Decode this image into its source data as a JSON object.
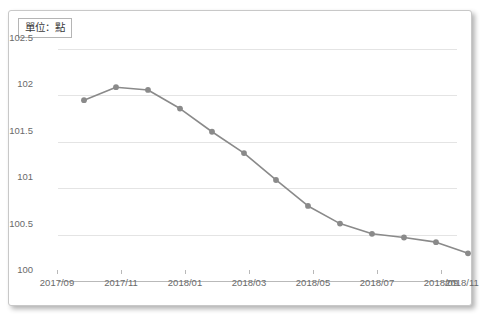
{
  "unit_label": "單位：點",
  "colors": {
    "line": "#8a8a8a",
    "marker": "#8a8a8a",
    "gridline": "#e4e4e4",
    "axis": "#b9b9b9",
    "tick_text": "#6a6a6a",
    "frame_border": "#c8c8c8",
    "background": "#ffffff"
  },
  "chart_data": {
    "type": "line",
    "title": "",
    "subtitle": "",
    "xlabel": "",
    "ylabel": "單位：點",
    "ylim": [
      100,
      102.5
    ],
    "ytick_labels": [
      "102.5",
      "102",
      "101.5",
      "101",
      "100.5",
      "100"
    ],
    "ytick_values": [
      102.5,
      102,
      101.5,
      101,
      100.5,
      100
    ],
    "xtick_labels": [
      "2017/09",
      "2017/11",
      "2018/01",
      "2018/03",
      "2018/05",
      "2018/07",
      "2018/09",
      "2018/11"
    ],
    "grid": true,
    "legend": "none",
    "markers": "circle",
    "x": [
      "2017/10",
      "2017/11",
      "2017/12",
      "2018/01",
      "2018/02",
      "2018/03",
      "2018/04",
      "2018/05",
      "2018/06",
      "2018/07",
      "2018/08",
      "2018/09",
      "2018/10"
    ],
    "values": [
      101.83,
      101.97,
      101.94,
      101.74,
      101.49,
      101.26,
      100.97,
      100.69,
      100.5,
      100.39,
      100.35,
      100.3,
      100.18
    ],
    "series": [
      {
        "name": "指數",
        "values": [
          101.83,
          101.97,
          101.94,
          101.74,
          101.49,
          101.26,
          100.97,
          100.69,
          100.5,
          100.39,
          100.35,
          100.3,
          100.18
        ]
      }
    ],
    "annotations": []
  }
}
